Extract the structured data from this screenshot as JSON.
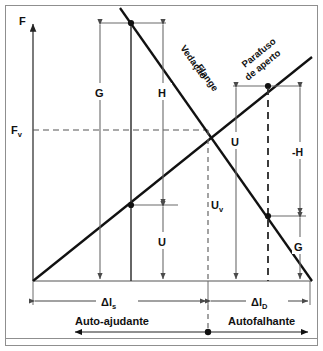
{
  "figure": {
    "type": "engineering-force-deflection-diagram",
    "axis": {
      "y_axis_label": "F",
      "y_tick_label": "F",
      "y_tick_subscript": "v"
    },
    "curves": [
      {
        "id": "descending",
        "label_line1": "Vedação",
        "label_line2": "Flange",
        "description": "gasket/flange stiffness line, negative slope"
      },
      {
        "id": "ascending",
        "label_line1": "Parafuso",
        "label_line2": "de aperto",
        "description": "clamping bolt stiffness line, positive slope"
      }
    ],
    "dimension_labels": {
      "g_left": "G",
      "h_left": "H",
      "u_left": "U",
      "u_center": "U",
      "uv": "U",
      "uv_subscript": "v",
      "h_right": "-H",
      "g_right": "G"
    },
    "bottom_dimensions": {
      "left_symbol": "Δl",
      "left_subscript": "s",
      "right_symbol": "Δl",
      "right_subscript": "D"
    },
    "zones": {
      "left": "Auto-ajudante",
      "right": "Autofalhante"
    },
    "colors": {
      "line": "#111111",
      "thin": "#6b6b6b",
      "dashed": "#555555",
      "frame": "#8a8a8a",
      "background": "#ffffff"
    }
  }
}
